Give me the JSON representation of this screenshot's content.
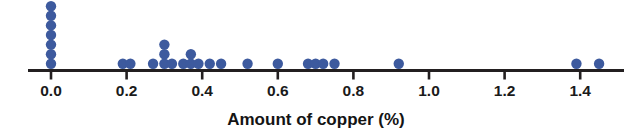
{
  "chart_data": {
    "type": "scatter",
    "plot_style": "dotplot",
    "title": "",
    "xlabel": "Amount of copper (%)",
    "ylabel": "",
    "xlim": [
      -0.03,
      1.47
    ],
    "ylim": [
      0,
      8
    ],
    "grid": false,
    "legend": null,
    "dot_color": "#3d5a9e",
    "axis_color": "#231f20",
    "background_color": "#ffffff",
    "xticks": [
      0.0,
      0.2,
      0.4,
      0.6,
      0.8,
      1.0,
      1.2,
      1.4
    ],
    "xtick_labels": [
      "0.0",
      "0.2",
      "0.4",
      "0.6",
      "0.8",
      "1.0",
      "1.2",
      "1.4"
    ],
    "x": [
      0.0,
      0.0,
      0.0,
      0.0,
      0.0,
      0.0,
      0.0,
      0.19,
      0.21,
      0.27,
      0.3,
      0.3,
      0.3,
      0.32,
      0.35,
      0.37,
      0.37,
      0.39,
      0.42,
      0.44,
      0.45,
      0.52,
      0.6,
      0.68,
      0.7,
      0.72,
      0.75,
      0.92,
      1.39,
      1.45
    ],
    "stacks": [
      {
        "value": 0.0,
        "count": 7
      },
      {
        "value": 0.19,
        "count": 1
      },
      {
        "value": 0.21,
        "count": 1
      },
      {
        "value": 0.27,
        "count": 1
      },
      {
        "value": 0.3,
        "count": 3
      },
      {
        "value": 0.32,
        "count": 1
      },
      {
        "value": 0.35,
        "count": 1
      },
      {
        "value": 0.37,
        "count": 2
      },
      {
        "value": 0.39,
        "count": 1
      },
      {
        "value": 0.42,
        "count": 1
      },
      {
        "value": 0.45,
        "count": 1
      },
      {
        "value": 0.52,
        "count": 1
      },
      {
        "value": 0.6,
        "count": 1
      },
      {
        "value": 0.68,
        "count": 1
      },
      {
        "value": 0.7,
        "count": 1
      },
      {
        "value": 0.72,
        "count": 1
      },
      {
        "value": 0.75,
        "count": 1
      },
      {
        "value": 0.92,
        "count": 1
      },
      {
        "value": 1.39,
        "count": 1
      },
      {
        "value": 1.45,
        "count": 1
      }
    ],
    "n_points": 30
  },
  "axis": {
    "title": "Amount of copper (%)",
    "tick_labels": [
      "0.0",
      "0.2",
      "0.4",
      "0.6",
      "0.8",
      "1.0",
      "1.2",
      "1.4"
    ]
  }
}
